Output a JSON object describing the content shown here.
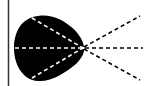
{
  "diagram": {
    "type": "optics-ray-diagram",
    "colors": {
      "background": "#ffffff",
      "body": "#000000",
      "inner_rays": "#ffffff",
      "outer_rays": "#000000",
      "boundary_line": "#333333"
    },
    "boundary_line": {
      "x": 8
    },
    "focal_point": {
      "x": 83,
      "y": 48
    },
    "rays": [
      {
        "name": "upper",
        "start": [
          30,
          18
        ],
        "end": [
          140,
          16
        ]
      },
      {
        "name": "middle",
        "start": [
          14,
          48
        ],
        "end": [
          142,
          48
        ]
      },
      {
        "name": "lower",
        "start": [
          30,
          78
        ],
        "end": [
          140,
          80
        ]
      }
    ]
  }
}
